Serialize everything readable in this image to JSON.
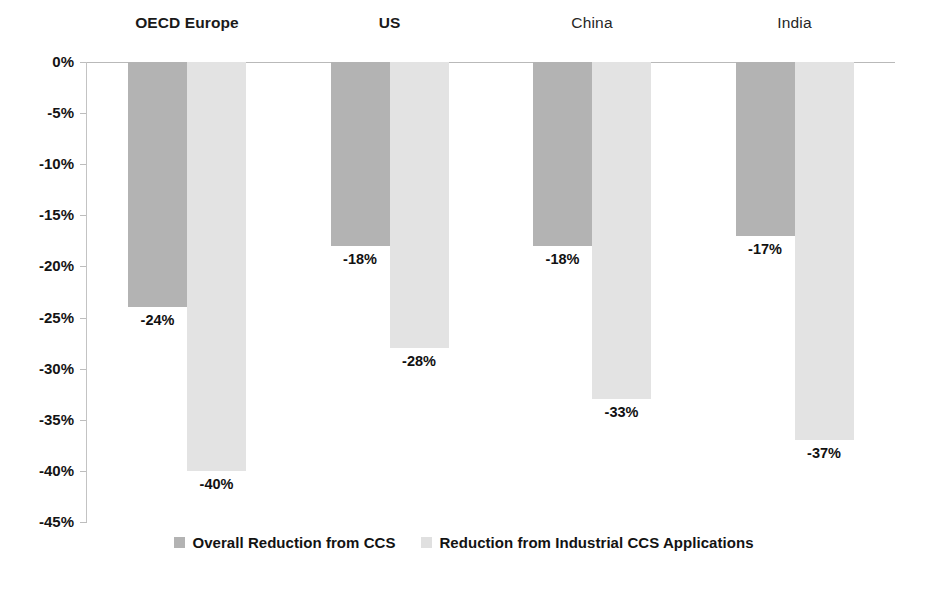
{
  "chart_data": {
    "type": "bar",
    "title": "",
    "subtitle": "",
    "xlabel": "",
    "ylabel": "",
    "orientation": "vertical",
    "grid": false,
    "legend_position": "bottom",
    "categories": [
      "OECD Europe",
      "US",
      "China",
      "India"
    ],
    "ylim": [
      -45,
      0
    ],
    "ytick_values": [
      0,
      -5,
      -10,
      -15,
      -20,
      -25,
      -30,
      -35,
      -40,
      -45
    ],
    "ytick_labels": [
      "0%",
      "-5%",
      "-10%",
      "-15%",
      "-20%",
      "-25%",
      "-30%",
      "-35%",
      "-40%",
      "-45%"
    ],
    "series": [
      {
        "name": "Overall Reduction from CCS",
        "color": "#b3b3b3",
        "values": [
          -24,
          -18,
          -18,
          -17
        ],
        "data_labels": [
          "-24%",
          "-18%",
          "-18%",
          "-17%"
        ]
      },
      {
        "name": "Reduction from Industrial CCS Applications",
        "color": "#e3e3e3",
        "values": [
          -40,
          -28,
          -33,
          -37
        ],
        "data_labels": [
          "-40%",
          "-28%",
          "-33%",
          "-37%"
        ]
      }
    ]
  },
  "legend": {
    "items": [
      {
        "label": "Overall Reduction from CCS",
        "color": "#b3b3b3"
      },
      {
        "label": "Reduction from Industrial CCS Applications",
        "color": "#e0e0e0"
      }
    ]
  },
  "axis": {
    "zero_line_color": "#b9b9b9",
    "spine_color": "#c3c3c3"
  }
}
